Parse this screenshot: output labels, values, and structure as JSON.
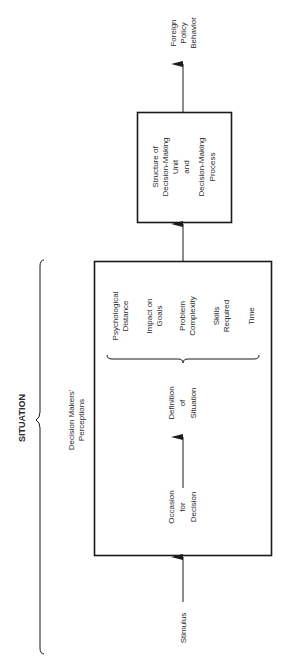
{
  "diagram": {
    "orientation": "rotated-90-ccw",
    "situation_label": "SITUATION",
    "perceptions_label": [
      "Decision Makers'",
      "Perceptions"
    ],
    "input": "Stimulus",
    "occasion": [
      "Occasion",
      "for",
      "Decision"
    ],
    "definition": [
      "Definition",
      "of",
      "Situation"
    ],
    "factors": [
      [
        "Psychological",
        "Distance"
      ],
      [
        "Impact on",
        "Goals"
      ],
      [
        "Problem",
        "Complexity"
      ],
      [
        "Skills",
        "Required"
      ],
      [
        "Time"
      ]
    ],
    "structure_box": [
      "Structure of",
      "Decision-Making",
      "Unit",
      "and",
      "Decision-Making",
      "Process"
    ],
    "output": [
      "Foreign",
      "Policy",
      "Behavior"
    ],
    "colors": {
      "line": "#1a1a1a",
      "text": "#2a2a2a",
      "background": "#ffffff"
    }
  }
}
